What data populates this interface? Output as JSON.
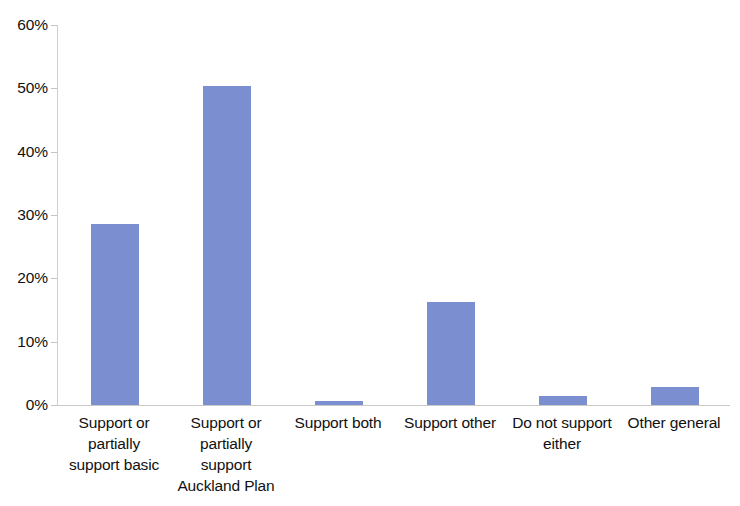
{
  "chart_data": {
    "type": "bar",
    "title": "",
    "subtitle": "",
    "xlabel": "",
    "ylabel": "",
    "categories": [
      "Support or\npartially\nsupport basic",
      "Support or\npartially\nsupport\nAuckland Plan",
      "Support both",
      "Support other",
      "Do not support\neither",
      "Other general"
    ],
    "values": [
      28.6,
      50.3,
      0.6,
      16.2,
      1.4,
      2.9
    ],
    "value_labels": [
      "28.6%",
      "50.3%",
      "0.6%",
      "16.2%",
      "1.4%",
      "2.9%"
    ],
    "ylim": [
      0,
      60
    ],
    "ytick_values": [
      0,
      10,
      20,
      30,
      40,
      50,
      60
    ],
    "ytick_labels": [
      "0%",
      "10%",
      "20%",
      "30%",
      "40%",
      "50%",
      "60%"
    ],
    "grid": false,
    "legend": false,
    "legend_position": "none",
    "series": [
      {
        "name": "Share of submissions",
        "values": [
          28.6,
          50.3,
          0.6,
          16.2,
          1.4,
          2.9
        ]
      }
    ],
    "colors": {
      "bar": "#7b8fd0",
      "axis": "#c9c9c9",
      "tick": "#c4c4c4",
      "text": "#111111",
      "background": "#ffffff"
    }
  }
}
